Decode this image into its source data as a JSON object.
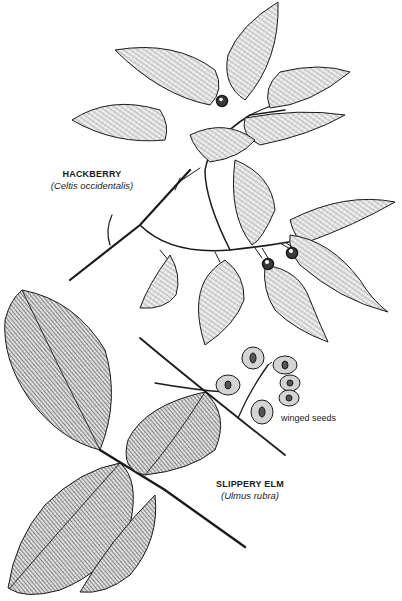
{
  "figure": {
    "hackberry": {
      "common_name": "HACKBERRY",
      "scientific_name": "(Celtis occidentalis)"
    },
    "slippery_elm": {
      "common_name": "SLIPPERY ELM",
      "scientific_name": "(Ulmus rubra)",
      "annotation": "winged seeds"
    }
  },
  "colors": {
    "ink": "#1a1a1a",
    "paper": "#ffffff",
    "leaf_fill": "#d9d9d9"
  }
}
